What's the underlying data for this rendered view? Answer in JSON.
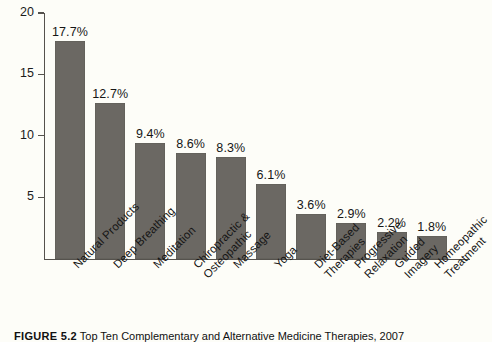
{
  "chart_data": {
    "type": "bar",
    "title": "",
    "xlabel": "",
    "ylabel": "",
    "ylim": [
      0,
      20
    ],
    "grid": false,
    "legend": false,
    "y_ticks": [
      "5",
      "10",
      "15",
      "20"
    ],
    "y_tick_values": [
      5,
      10,
      15,
      20
    ],
    "categories": [
      "Natural Products",
      "Deep Breathing",
      "Meditation",
      "Chiropractic &\nOsteopathic",
      "Massage",
      "Yoga",
      "Diet-Based\nTherapies",
      "Progressive\nRelaxation",
      "Guided Imagery",
      "Homeopathic\nTreatment"
    ],
    "values": [
      17.7,
      12.7,
      9.4,
      8.6,
      8.3,
      6.1,
      3.6,
      2.9,
      2.2,
      1.8
    ],
    "value_labels": [
      "17.7%",
      "12.7%",
      "9.4%",
      "8.6%",
      "8.3%",
      "6.1%",
      "3.6%",
      "2.9%",
      "2.2%",
      "1.8%"
    ],
    "bar_color": "#6b6863",
    "background_color": "#fdfdf8",
    "axis_color": "#55524d"
  },
  "caption": {
    "number": "FIGURE 5.2",
    "text": "Top Ten Complementary and Alternative Medicine Therapies, 2007"
  }
}
